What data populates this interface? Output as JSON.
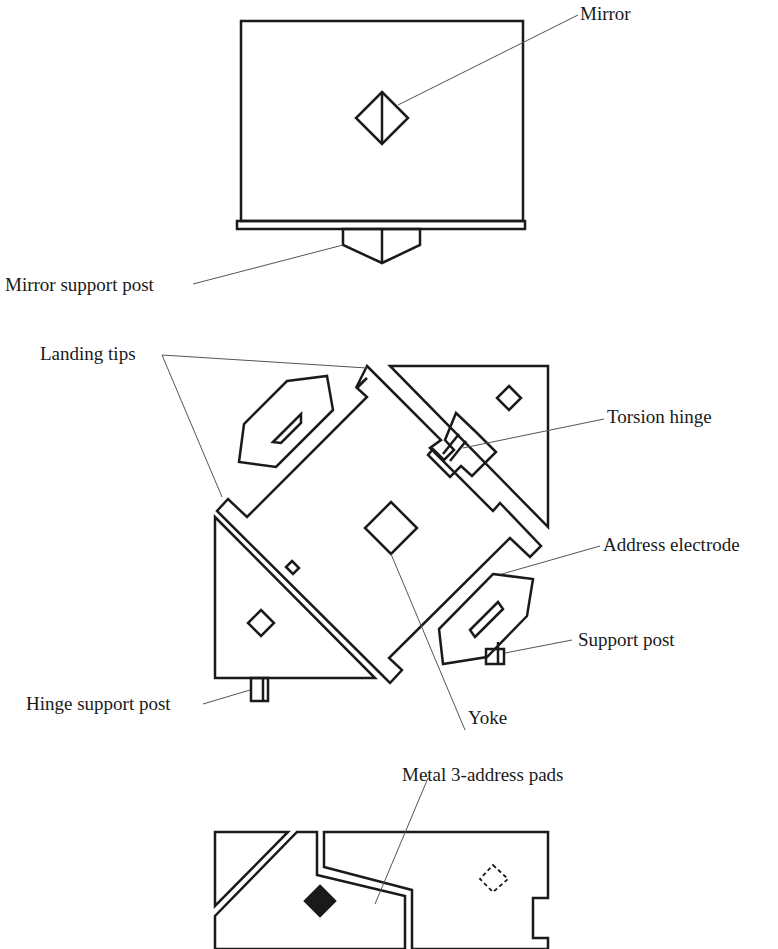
{
  "figure": {
    "line_color": "#1a1a1a",
    "leader_color": "#555555",
    "labels": {
      "mirror": "Mirror",
      "mirror_support_post": "Mirror support post",
      "landing_tips": "Landing tips",
      "torsion_hinge": "Torsion hinge",
      "address_electrode": "Address electrode",
      "support_post": "Support post",
      "hinge_support_post": "Hinge support post",
      "yoke": "Yoke",
      "metal_address_pads": "Metal 3-address pads"
    }
  }
}
